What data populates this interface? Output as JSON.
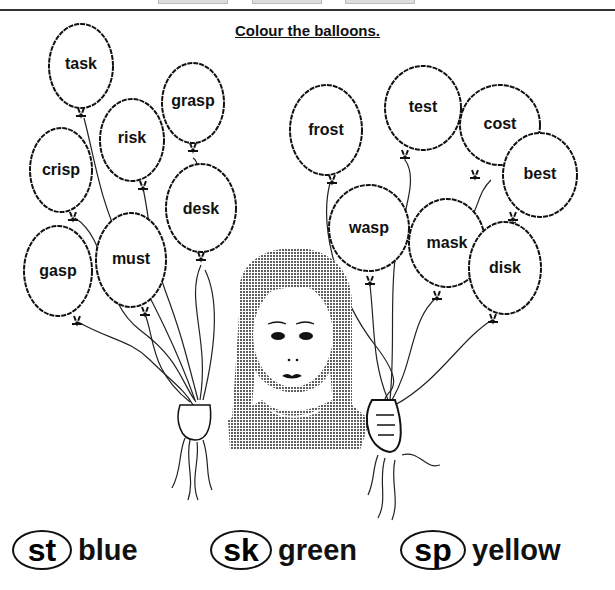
{
  "header": {
    "title": "Colour the balloons."
  },
  "balloons": [
    {
      "word": "task",
      "cx": 81,
      "cy": 66
    },
    {
      "word": "grasp",
      "cx": 193,
      "cy": 103
    },
    {
      "word": "risk",
      "cx": 132,
      "cy": 140
    },
    {
      "word": "crisp",
      "cx": 61,
      "cy": 170
    },
    {
      "word": "desk",
      "cx": 201,
      "cy": 208
    },
    {
      "word": "must",
      "cx": 131,
      "cy": 260
    },
    {
      "word": "gasp",
      "cx": 58,
      "cy": 271
    },
    {
      "word": "frost",
      "cx": 326,
      "cy": 130
    },
    {
      "word": "test",
      "cx": 423,
      "cy": 108
    },
    {
      "word": "cost",
      "cx": 500,
      "cy": 125
    },
    {
      "word": "best",
      "cx": 540,
      "cy": 175
    },
    {
      "word": "wasp",
      "cx": 369,
      "cy": 228
    },
    {
      "word": "mask",
      "cx": 447,
      "cy": 243
    },
    {
      "word": "disk",
      "cx": 505,
      "cy": 268
    }
  ],
  "key": [
    {
      "blend": "st",
      "color_name": "blue"
    },
    {
      "blend": "sk",
      "color_name": "green"
    },
    {
      "blend": "sp",
      "color_name": "yellow"
    }
  ]
}
